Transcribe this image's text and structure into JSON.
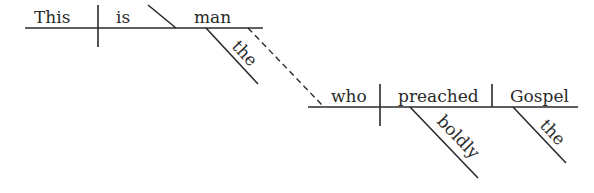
{
  "diagram": {
    "type": "reed-kellogg-sentence-diagram",
    "sentence": "This is the man who preached the Gospel boldly",
    "main_clause": {
      "subject": "This",
      "verb": "is",
      "complement": "man",
      "complement_modifier": "the"
    },
    "relative_clause": {
      "subject": "who",
      "verb": "preached",
      "object": "Gospel",
      "verb_modifier": "boldly",
      "object_modifier": "the"
    },
    "connector": "dashed"
  }
}
